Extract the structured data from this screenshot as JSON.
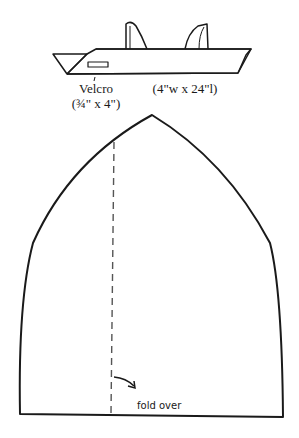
{
  "headband": {
    "velcro_label": "Velcro",
    "velcro_size": "(¾\" x 4\")",
    "band_size": "(4\"w x 24\"l)"
  },
  "pattern": {
    "fold_label": "fold over"
  },
  "colors": {
    "line": "#1a1a1a",
    "dash": "#555555",
    "background": "#ffffff"
  }
}
